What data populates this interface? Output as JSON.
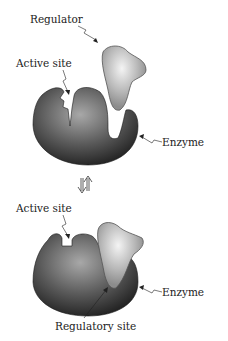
{
  "top_panel": {
    "labels": {
      "regulator": "Regulator",
      "active_site": "Active site",
      "enzyme": "Enzyme"
    }
  },
  "equilibrium_arrow": "⇅",
  "bottom_panel": {
    "labels": {
      "active_site": "Active site",
      "enzyme": "Enzyme",
      "regulatory_site": "Regulatory site"
    }
  },
  "colors": {
    "enzyme_dark": "#2a2a2a",
    "enzyme_light": "#9a9a9a",
    "regulator_fill": "#b0b0b0",
    "regulator_highlight": "#f2f2f2"
  }
}
